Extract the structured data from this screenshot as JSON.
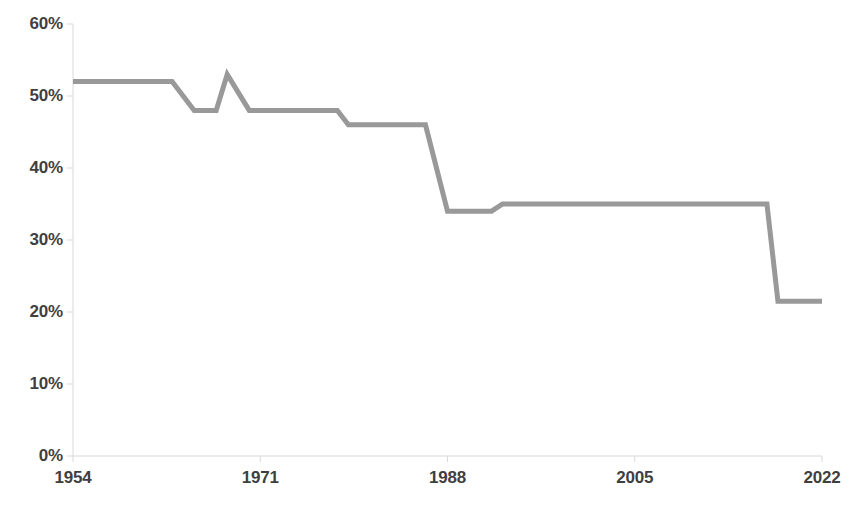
{
  "chart_data": {
    "type": "line",
    "title": "",
    "subtitle": "",
    "xlabel": "",
    "ylabel": "",
    "x_tick_labels": [
      "1954",
      "1971",
      "1988",
      "2005",
      "2022"
    ],
    "x_tick_values": [
      1954,
      1971,
      1988,
      2005,
      2022
    ],
    "y_tick_labels": [
      "0%",
      "10%",
      "20%",
      "30%",
      "40%",
      "50%",
      "60%"
    ],
    "y_tick_values": [
      0,
      10,
      20,
      30,
      40,
      50,
      60
    ],
    "xlim": [
      1954,
      2022
    ],
    "ylim": [
      0,
      60
    ],
    "grid": false,
    "legend": false,
    "legend_position": "none",
    "series": [
      {
        "name": "series-1",
        "color": "#999999",
        "line_width": 5,
        "markers": false,
        "x": [
          1954,
          1963,
          1965,
          1967,
          1968,
          1970,
          1978,
          1979,
          1986,
          1988,
          1992,
          1993,
          2017,
          2018,
          2022
        ],
        "values": [
          52,
          52,
          48,
          48,
          53,
          48,
          48,
          46,
          46,
          34,
          34,
          35,
          35,
          21.5,
          21.5
        ]
      }
    ],
    "annotations": []
  },
  "style": {
    "line_color": "#999999",
    "axis_color": "#d9d9d9",
    "tick_color": "#d9d9d9",
    "label_color": "#3f3f3f",
    "background": "#ffffff"
  },
  "geometry": {
    "plot_left": 73,
    "plot_right": 822,
    "plot_top": 24,
    "plot_bottom": 456
  }
}
